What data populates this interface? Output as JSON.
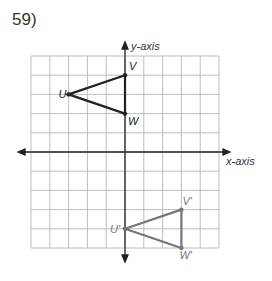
{
  "problem_number": "59)",
  "axes": {
    "x_label": "x-axis",
    "y_label": "y-axis"
  },
  "grid": {
    "cols": 10,
    "rows": 10,
    "xmin": -5,
    "xmax": 5,
    "ymin": -5,
    "ymax": 5
  },
  "original": {
    "color": "#222222",
    "points": [
      {
        "label": "U",
        "x": -3,
        "y": 3
      },
      {
        "label": "V",
        "x": 0,
        "y": 4
      },
      {
        "label": "W",
        "x": 0,
        "y": 2
      }
    ]
  },
  "image": {
    "color": "#777777",
    "points": [
      {
        "label": "U'",
        "x": 0,
        "y": -4
      },
      {
        "label": "V'",
        "x": 3,
        "y": -3
      },
      {
        "label": "W'",
        "x": 3,
        "y": -5
      }
    ]
  }
}
